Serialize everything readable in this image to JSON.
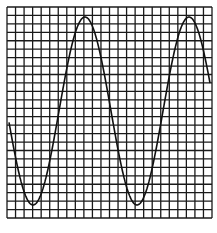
{
  "figure": {
    "grid": {
      "left": 7,
      "top": 7,
      "right": 212,
      "bottom": 218,
      "columns": 24,
      "rows": 25,
      "line_color": "#1a1a1a",
      "line_width": 1.3
    },
    "wave": {
      "type": "sinusoid",
      "color": "#111111",
      "stroke_width": 1.6,
      "x_start": 9,
      "x_end": 210,
      "center_y": 111,
      "amplitude": 94,
      "period": 104,
      "trough_x": 33,
      "peaks": [
        [
          83,
          17
        ],
        [
          187,
          16
        ]
      ],
      "troughs": [
        [
          33,
          205
        ],
        [
          138,
          205
        ]
      ]
    }
  }
}
